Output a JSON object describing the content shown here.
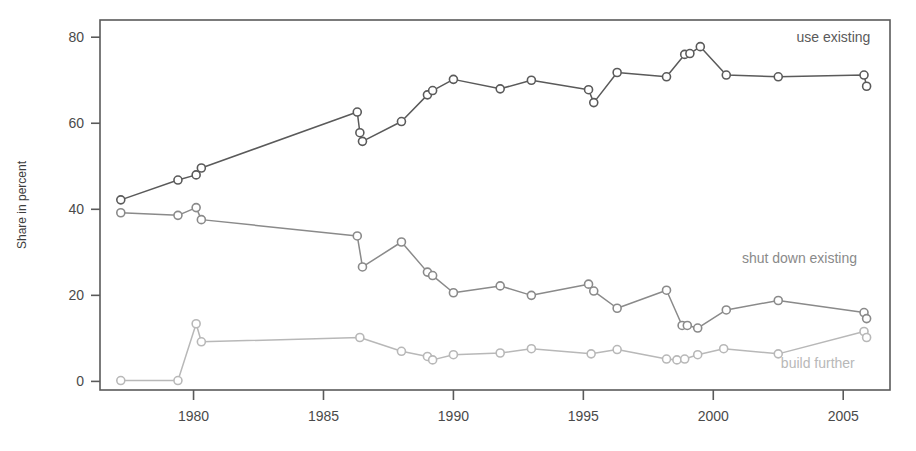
{
  "chart_data": {
    "type": "line",
    "title": "",
    "xlabel": "",
    "ylabel": "Share in percent",
    "xlim": [
      1976.4,
      2006.8
    ],
    "ylim": [
      -2,
      84
    ],
    "xticks": [
      1980,
      1985,
      1990,
      1995,
      2000,
      2005
    ],
    "yticks": [
      0,
      20,
      40,
      60,
      80
    ],
    "grid": false,
    "legend_position": "inline-right",
    "series": [
      {
        "name": "use existing",
        "color": "#5a5a5a",
        "label": "use existing",
        "label_x": 2003.2,
        "label_y": 79,
        "points": [
          {
            "x": 1977.2,
            "y": 42.2
          },
          {
            "x": 1979.4,
            "y": 46.8
          },
          {
            "x": 1980.1,
            "y": 48.0
          },
          {
            "x": 1980.3,
            "y": 49.6
          },
          {
            "x": 1986.3,
            "y": 62.6
          },
          {
            "x": 1986.4,
            "y": 57.8
          },
          {
            "x": 1986.5,
            "y": 55.8
          },
          {
            "x": 1988.0,
            "y": 60.4
          },
          {
            "x": 1989.0,
            "y": 66.6
          },
          {
            "x": 1989.2,
            "y": 67.6
          },
          {
            "x": 1990.0,
            "y": 70.2
          },
          {
            "x": 1991.8,
            "y": 68.0
          },
          {
            "x": 1993.0,
            "y": 70.0
          },
          {
            "x": 1995.2,
            "y": 67.8
          },
          {
            "x": 1995.4,
            "y": 64.8
          },
          {
            "x": 1996.3,
            "y": 71.8
          },
          {
            "x": 1998.2,
            "y": 70.8
          },
          {
            "x": 1998.9,
            "y": 76.0
          },
          {
            "x": 1999.1,
            "y": 76.2
          },
          {
            "x": 1999.5,
            "y": 77.8
          },
          {
            "x": 2000.5,
            "y": 71.2
          },
          {
            "x": 2002.5,
            "y": 70.8
          },
          {
            "x": 2005.8,
            "y": 71.2
          },
          {
            "x": 2005.9,
            "y": 68.6
          }
        ]
      },
      {
        "name": "shut down existing",
        "color": "#8a8a8a",
        "label": "shut down existing",
        "label_x": 2001.1,
        "label_y": 27.5,
        "points": [
          {
            "x": 1977.2,
            "y": 39.2
          },
          {
            "x": 1979.4,
            "y": 38.6
          },
          {
            "x": 1980.1,
            "y": 40.4
          },
          {
            "x": 1980.3,
            "y": 37.6
          },
          {
            "x": 1986.3,
            "y": 33.8
          },
          {
            "x": 1986.5,
            "y": 26.6
          },
          {
            "x": 1988.0,
            "y": 32.4
          },
          {
            "x": 1989.0,
            "y": 25.4
          },
          {
            "x": 1989.2,
            "y": 24.6
          },
          {
            "x": 1990.0,
            "y": 20.6
          },
          {
            "x": 1991.8,
            "y": 22.2
          },
          {
            "x": 1993.0,
            "y": 20.0
          },
          {
            "x": 1995.2,
            "y": 22.6
          },
          {
            "x": 1995.4,
            "y": 21.0
          },
          {
            "x": 1996.3,
            "y": 17.0
          },
          {
            "x": 1998.2,
            "y": 21.2
          },
          {
            "x": 1998.8,
            "y": 13.0
          },
          {
            "x": 1999.0,
            "y": 13.0
          },
          {
            "x": 1999.4,
            "y": 12.4
          },
          {
            "x": 2000.5,
            "y": 16.6
          },
          {
            "x": 2002.5,
            "y": 18.8
          },
          {
            "x": 2005.8,
            "y": 16.0
          },
          {
            "x": 2005.9,
            "y": 14.6
          }
        ]
      },
      {
        "name": "build further",
        "color": "#b8b8b8",
        "label": "build further",
        "label_x": 2002.6,
        "label_y": 3.0,
        "points": [
          {
            "x": 1977.2,
            "y": 0.2
          },
          {
            "x": 1979.4,
            "y": 0.2
          },
          {
            "x": 1980.1,
            "y": 13.4
          },
          {
            "x": 1980.3,
            "y": 9.2
          },
          {
            "x": 1986.4,
            "y": 10.2
          },
          {
            "x": 1988.0,
            "y": 7.0
          },
          {
            "x": 1989.0,
            "y": 5.8
          },
          {
            "x": 1989.2,
            "y": 5.0
          },
          {
            "x": 1990.0,
            "y": 6.2
          },
          {
            "x": 1991.8,
            "y": 6.6
          },
          {
            "x": 1993.0,
            "y": 7.6
          },
          {
            "x": 1995.3,
            "y": 6.4
          },
          {
            "x": 1996.3,
            "y": 7.4
          },
          {
            "x": 1998.2,
            "y": 5.2
          },
          {
            "x": 1998.6,
            "y": 5.0
          },
          {
            "x": 1998.9,
            "y": 5.2
          },
          {
            "x": 1999.4,
            "y": 6.2
          },
          {
            "x": 2000.4,
            "y": 7.6
          },
          {
            "x": 2002.5,
            "y": 6.4
          },
          {
            "x": 2005.8,
            "y": 11.6
          },
          {
            "x": 2005.9,
            "y": 10.2
          }
        ]
      }
    ]
  },
  "axes": {
    "y_title": "Share in percent",
    "x_tick_labels": [
      "1980",
      "1985",
      "1990",
      "1995",
      "2000",
      "2005"
    ],
    "y_tick_labels": [
      "0",
      "20",
      "40",
      "60",
      "80"
    ]
  },
  "colors": {
    "frame": "#5a5a5a",
    "use_existing": "#5a5a5a",
    "shut_down_existing": "#8a8a8a",
    "build_further": "#b8b8b8",
    "background": "#ffffff",
    "tick_text": "#4a4a4a"
  }
}
